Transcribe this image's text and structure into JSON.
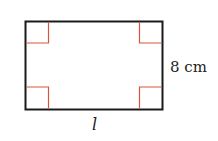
{
  "diagram": {
    "shape": "rectangle",
    "labels": {
      "height": "8 cm",
      "length": "l"
    },
    "colors": {
      "outline": "#1a1a1a",
      "right_angle_marker": "#d9553a"
    }
  }
}
